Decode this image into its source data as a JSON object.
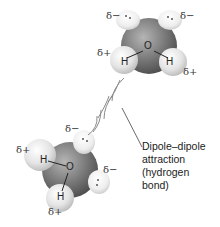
{
  "diagram": {
    "molecule_top": {
      "atoms": {
        "oxygen": "O",
        "hydrogen_left": "H",
        "hydrogen_right": "H"
      },
      "charges": {
        "lone_pair_left": "δ−",
        "lone_pair_right": "δ−",
        "hydrogen_left": "δ+",
        "hydrogen_right": "δ+"
      }
    },
    "molecule_bottom": {
      "atoms": {
        "oxygen": "O",
        "hydrogen_left": "H",
        "hydrogen_bottom": "H"
      },
      "charges": {
        "lone_pair_top": "δ−",
        "lone_pair_right": "δ−",
        "hydrogen_left": "δ+",
        "hydrogen_bottom": "δ+"
      }
    },
    "annotation": {
      "lines": [
        "Dipole–dipole",
        "attraction",
        "(hydrogen",
        "bond)"
      ]
    },
    "colors": {
      "oxygen": "#7a7a7a",
      "hydrogen": "#e8e8e8",
      "lone_pair": "#f2f2f2",
      "arcs": "#8a8a8a",
      "text": "#222222"
    }
  }
}
